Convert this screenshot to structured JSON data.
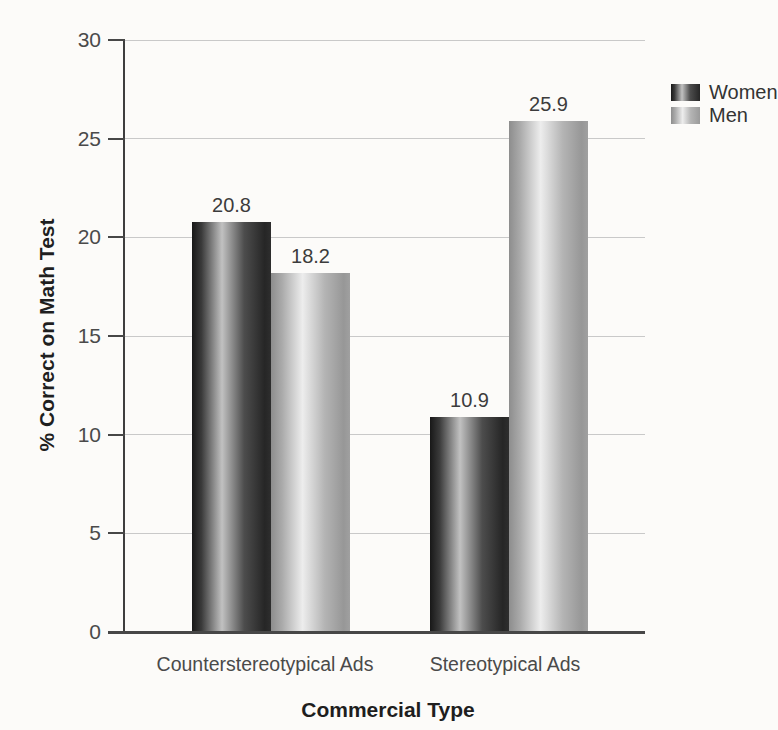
{
  "chart_data": {
    "type": "bar",
    "categories": [
      "Counterstereotypical Ads",
      "Stereotypical Ads"
    ],
    "series": [
      {
        "name": "Women",
        "values": [
          20.8,
          10.9
        ]
      },
      {
        "name": "Men",
        "values": [
          18.2,
          25.9
        ]
      }
    ],
    "xlabel": "Commercial Type",
    "ylabel": "% Correct on Math Test",
    "ylim": [
      0,
      30
    ],
    "yticks": [
      0,
      5,
      10,
      15,
      20,
      25,
      30
    ],
    "grid": true,
    "legend_position": "top-right",
    "value_label_decimals": 1
  },
  "colors": {
    "women_bar_dark": "#181818",
    "women_bar_highlight": "#c1c1c1",
    "men_bar_dark": "#8d8d8d",
    "men_bar_highlight": "#ededed",
    "gridline": "#c9c9c9",
    "axis": "#474747",
    "tick_text": "#4a4a4a",
    "title_text": "#1e1e1e",
    "background": "#fcfbf9"
  }
}
